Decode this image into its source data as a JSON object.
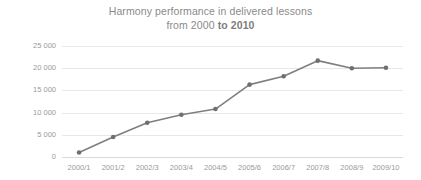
{
  "chart_data": {
    "type": "line",
    "title": "Harmony performance in delivered lessons",
    "title_line1": "Harmony performance in delivered lessons",
    "title_line2_prefix": "from 2000 ",
    "title_line2_bold": "to 2010",
    "xlabel": "",
    "ylabel": "",
    "categories": [
      "2000/1",
      "2001/2",
      "2002/3",
      "2003/4",
      "2004/5",
      "2005/6",
      "2006/7",
      "2007/8",
      "2008/9",
      "2009/10"
    ],
    "values": [
      1000,
      4500,
      7700,
      9500,
      10800,
      16300,
      18200,
      21700,
      20000,
      20100
    ],
    "ylim": [
      0,
      25000
    ],
    "ytick_values": [
      0,
      5000,
      10000,
      15000,
      20000,
      25000
    ],
    "ytick_labels": [
      "0",
      "5 000",
      "10 000",
      "15 000",
      "20 000",
      "25 000"
    ],
    "grid": "horizontal",
    "legend": "none",
    "series": [
      {
        "name": "Harmony delivered lessons",
        "values": [
          1000,
          4500,
          7700,
          9500,
          10800,
          16300,
          18200,
          21700,
          20000,
          20100
        ]
      }
    ],
    "colors": {
      "line": "#7f7f7f",
      "marker": "#6f6f6f",
      "gridline": "#e8e8e8",
      "text": "#8a8a8a",
      "background": "#ffffff"
    },
    "marker_style": "circle",
    "annotations": []
  }
}
